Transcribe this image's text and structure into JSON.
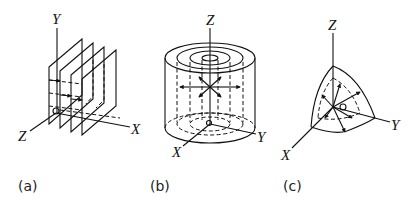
{
  "figure": {
    "panels": [
      {
        "id": "a",
        "caption": "(a)",
        "shape": "parallel planes",
        "axes": {
          "x": "X",
          "y": "Y",
          "z": "Z"
        },
        "origin": "O",
        "plane_count": 4
      },
      {
        "id": "b",
        "caption": "(b)",
        "shape": "coaxial cylinders",
        "axes": {
          "x": "X",
          "y": "Y",
          "z": "Z"
        },
        "origin": "O",
        "ring_count": 4
      },
      {
        "id": "c",
        "caption": "(c)",
        "shape": "spherical octant shells",
        "axes": {
          "x": "X",
          "y": "Y",
          "z": "Z"
        },
        "origin": "O"
      }
    ]
  }
}
